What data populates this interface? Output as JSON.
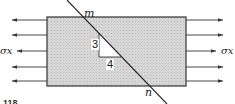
{
  "diagram": {
    "labels": {
      "cut_top": "m",
      "cut_bottom": "n",
      "stress_left": "σx",
      "stress_right": "σx",
      "slope_rise": "3",
      "slope_run": "4",
      "figure_number": "118"
    },
    "arrows_per_side": 5,
    "colors": {
      "block_fill": "#cfcfcf",
      "outline": "#333333",
      "background": "#ffffff"
    }
  }
}
